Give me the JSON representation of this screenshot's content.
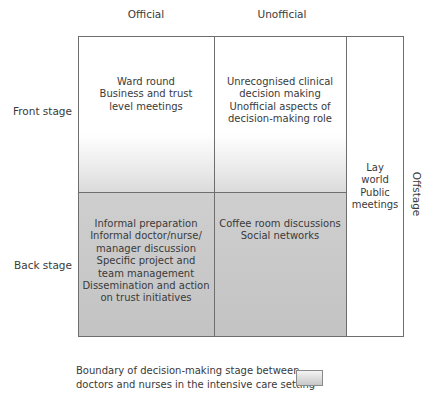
{
  "diagram": {
    "columns": [
      "Official",
      "Unofficial"
    ],
    "rows": [
      "Front stage",
      "Back stage"
    ],
    "offstage_label": "Offstage",
    "cells": {
      "front_official": [
        "Ward round",
        "Business and trust",
        "level meetings"
      ],
      "front_unofficial": [
        "Unrecognised clinical",
        "decision making",
        "Unofficial aspects of",
        "decision-making role"
      ],
      "back_official": [
        "Informal preparation",
        "Informal doctor/nurse/",
        "manager discussion",
        "Specific project and",
        "team management",
        "Dissemination and action",
        "on trust initiatives"
      ],
      "back_unofficial": [
        "Coffee room discussions",
        "Social networks"
      ],
      "offstage": [
        "Lay",
        "world",
        "Public",
        "meetings"
      ]
    },
    "legend": {
      "text_line1": "Boundary of decision-making stage between",
      "text_line2": "doctors and nurses in the intensive care setting"
    },
    "colors": {
      "line": "#6e6e6e",
      "backstage_fill": "#c8c8c8",
      "text": "#3a3a3a"
    }
  }
}
